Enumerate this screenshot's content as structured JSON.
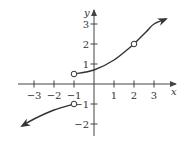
{
  "chart_data": {
    "type": "line",
    "title": "",
    "xlabel": "x",
    "ylabel": "y",
    "xlim": [
      -3.6,
      3.8
    ],
    "ylim": [
      -2.4,
      3.4
    ],
    "grid": false,
    "x_ticks": [
      -3,
      -2,
      -1,
      1,
      2,
      3
    ],
    "y_ticks": [
      3,
      2,
      1,
      -1,
      -2
    ],
    "x_tick_labels": [
      "−3",
      "−2",
      "−1",
      "1",
      "2",
      "3"
    ],
    "y_tick_labels": [
      "3",
      "2",
      "1",
      "−1",
      "−2"
    ],
    "series": [
      {
        "name": "left-branch",
        "points": [
          [
            -3.6,
            -2.1
          ],
          [
            -3,
            -1.75
          ],
          [
            -2,
            -1.3
          ],
          [
            -1,
            -1
          ]
        ],
        "start_arrow": true,
        "end_marker": "open"
      },
      {
        "name": "middle-branch",
        "points": [
          [
            -1,
            0.5
          ],
          [
            0,
            0.7
          ],
          [
            1,
            1.2
          ],
          [
            2,
            2
          ]
        ],
        "start_marker": "open",
        "end_marker": "open"
      },
      {
        "name": "right-branch",
        "points": [
          [
            2,
            2
          ],
          [
            2.6,
            2.6
          ],
          [
            3,
            3
          ],
          [
            3.6,
            3.25
          ]
        ],
        "end_arrow": true
      }
    ],
    "open_points": [
      [
        -1,
        0.5
      ],
      [
        -1,
        -1
      ],
      [
        2,
        2
      ]
    ],
    "colors": {
      "curve": "#333333",
      "axis": "#444444"
    }
  }
}
